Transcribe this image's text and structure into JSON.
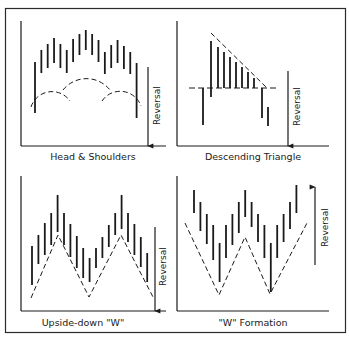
{
  "figure": {
    "panels": [
      {
        "id": "head-shoulders",
        "caption": "Head & Shoulders",
        "reversal_label": "Reversal",
        "reversal_direction": "down",
        "bars": [
          [
            62,
            113
          ],
          [
            50,
            73
          ],
          [
            44,
            68
          ],
          [
            38,
            63
          ],
          [
            44,
            68
          ],
          [
            50,
            73
          ],
          [
            39,
            62
          ],
          [
            34,
            55
          ],
          [
            30,
            50
          ],
          [
            34,
            55
          ],
          [
            40,
            62
          ],
          [
            52,
            74
          ],
          [
            45,
            68
          ],
          [
            40,
            63
          ],
          [
            46,
            69
          ],
          [
            52,
            74
          ],
          [
            63,
            118
          ]
        ],
        "neckline_style": "dashed arcs (left shoulder, head, right shoulder)"
      },
      {
        "id": "descending-triangle",
        "caption": "Descending Triangle",
        "reversal_label": "Reversal",
        "reversal_direction": "down",
        "bars": [
          [
            88,
            125
          ],
          [
            41,
            97
          ],
          [
            47,
            88
          ],
          [
            52,
            88
          ],
          [
            57,
            88
          ],
          [
            62,
            88
          ],
          [
            67,
            88
          ],
          [
            72,
            88
          ],
          [
            78,
            88
          ],
          [
            88,
            118
          ],
          [
            107,
            126
          ]
        ],
        "trendlines": [
          "dashed descending resistance",
          "dashed horizontal support"
        ]
      },
      {
        "id": "upside-down-w",
        "caption": "Upside-down \"W\"",
        "reversal_label": "Reversal",
        "reversal_direction": "down",
        "bars": [
          [
            81,
            120
          ],
          [
            70,
            99
          ],
          [
            58,
            90
          ],
          [
            48,
            80
          ],
          [
            30,
            67
          ],
          [
            48,
            80
          ],
          [
            59,
            92
          ],
          [
            71,
            103
          ],
          [
            83,
            113
          ],
          [
            93,
            117
          ],
          [
            83,
            103
          ],
          [
            72,
            93
          ],
          [
            60,
            82
          ],
          [
            48,
            70
          ],
          [
            30,
            64
          ],
          [
            48,
            77
          ],
          [
            59,
            90
          ],
          [
            72,
            102
          ],
          [
            88,
            117
          ]
        ],
        "trendlines": [
          "dashed inverted W"
        ]
      },
      {
        "id": "w-formation",
        "caption": "\"W\" Formation",
        "reversal_label": "Reversal",
        "reversal_direction": "up",
        "bars": [
          [
            25,
            48
          ],
          [
            37,
            66
          ],
          [
            49,
            79
          ],
          [
            60,
            95
          ],
          [
            78,
            117
          ],
          [
            60,
            93
          ],
          [
            49,
            80
          ],
          [
            37,
            68
          ],
          [
            25,
            52
          ],
          [
            37,
            62
          ],
          [
            49,
            77
          ],
          [
            60,
            93
          ],
          [
            78,
            127
          ],
          [
            60,
            93
          ],
          [
            49,
            77
          ],
          [
            37,
            64
          ],
          [
            20,
            48
          ]
        ],
        "trendlines": [
          "dashed W"
        ]
      }
    ]
  }
}
